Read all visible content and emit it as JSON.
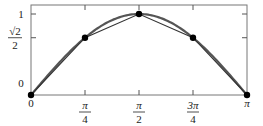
{
  "chart_data": {
    "type": "line",
    "title": "",
    "xlabel": "",
    "ylabel": "",
    "xlim": [
      0,
      3.14159265
    ],
    "ylim": [
      0,
      1
    ],
    "grid": false,
    "legend": "none",
    "x_ticks": [
      {
        "value": 0,
        "num": "0",
        "den": ""
      },
      {
        "value": 0.78539816,
        "num": "π",
        "den": "4"
      },
      {
        "value": 1.57079633,
        "num": "π",
        "den": "2"
      },
      {
        "value": 2.35619449,
        "num": "3π",
        "den": "4"
      },
      {
        "value": 3.14159265,
        "num": "π",
        "den": ""
      }
    ],
    "y_ticks": [
      {
        "value": 0,
        "num": "0",
        "den": ""
      },
      {
        "value": 0.70710678,
        "num": "√2",
        "den": "2"
      },
      {
        "value": 1,
        "num": "1",
        "den": ""
      }
    ],
    "series": [
      {
        "name": "sin(x)",
        "kind": "curve",
        "function": "sin",
        "color": "#555555"
      },
      {
        "name": "chord-approximation",
        "kind": "polyline",
        "color": "#333333",
        "x": [
          0,
          0.78539816,
          1.57079633,
          2.35619449,
          3.14159265
        ],
        "y": [
          0,
          0.70710678,
          1,
          0.70710678,
          0
        ],
        "markers": true
      }
    ]
  }
}
